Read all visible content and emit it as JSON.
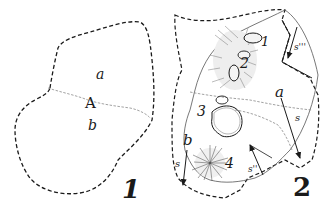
{
  "figure": {
    "panels": [
      {
        "id": "1",
        "number_label": "1",
        "labels": {
          "upper": "a",
          "center": "A",
          "lower": "b"
        }
      },
      {
        "id": "2",
        "number_label": "2",
        "labels": {
          "region_a": "a",
          "region_b": "b",
          "feature_1": "1",
          "feature_2": "2",
          "feature_3": "3",
          "feature_4": "4",
          "arrow_s_main": "s",
          "arrow_s_left": "s",
          "arrow_s_top_right": "s'''",
          "arrow_s_bottom": "s''"
        }
      }
    ],
    "colors": {
      "ink": "#1a1a1a",
      "faint_line": "#8a8a8a",
      "background": "#ffffff"
    }
  }
}
